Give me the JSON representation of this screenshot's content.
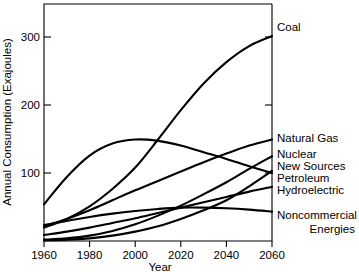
{
  "chart_data": {
    "type": "line",
    "title": "",
    "xlabel": "Year",
    "ylabel": "Annual Consumption (Exajoules)",
    "xlim": [
      1960,
      2060
    ],
    "ylim": [
      0,
      355
    ],
    "xticks": [
      1960,
      1980,
      2000,
      2020,
      2040,
      2060
    ],
    "xtick_labels": [
      "1960",
      "1980",
      "2000",
      "2020",
      "2040",
      "2060"
    ],
    "yticks": [
      100,
      200,
      300
    ],
    "ytick_labels": [
      "100",
      "200",
      "300"
    ],
    "grid": false,
    "legend_position": "right-of-axes-inline",
    "x": [
      1960,
      1970,
      1980,
      1990,
      2000,
      2010,
      2020,
      2030,
      2040,
      2050,
      2060
    ],
    "series": [
      {
        "name": "Coal",
        "label": "Coal",
        "values": [
          20,
          33,
          52,
          78,
          110,
          152,
          196,
          236,
          268,
          292,
          307
        ]
      },
      {
        "name": "Natural Gas",
        "label": "Natural Gas",
        "values": [
          22,
          33,
          46,
          61,
          76,
          90,
          104,
          118,
          131,
          143,
          152
        ]
      },
      {
        "name": "Nuclear",
        "label": "Nuclear",
        "values": [
          2,
          4,
          8,
          15,
          25,
          38,
          53,
          70,
          88,
          108,
          127
        ]
      },
      {
        "name": "New Sources",
        "label": "New Sources",
        "values": [
          1,
          2,
          4,
          8,
          14,
          22,
          33,
          46,
          61,
          82,
          105
        ]
      },
      {
        "name": "Petroleum",
        "label": "Petroleum",
        "values": [
          55,
          96,
          128,
          146,
          152,
          150,
          143,
          133,
          123,
          112,
          102
        ]
      },
      {
        "name": "Hydroelectric",
        "label": "Hydroelectric",
        "values": [
          9,
          14,
          20,
          27,
          34,
          42,
          50,
          58,
          66,
          74,
          81
        ]
      },
      {
        "name": "Noncommercial Energies",
        "label_line1": "Noncommercial",
        "label_line2": "Energies",
        "values": [
          24,
          30,
          36,
          41,
          45,
          48,
          50,
          50,
          49,
          47,
          44
        ]
      }
    ]
  }
}
